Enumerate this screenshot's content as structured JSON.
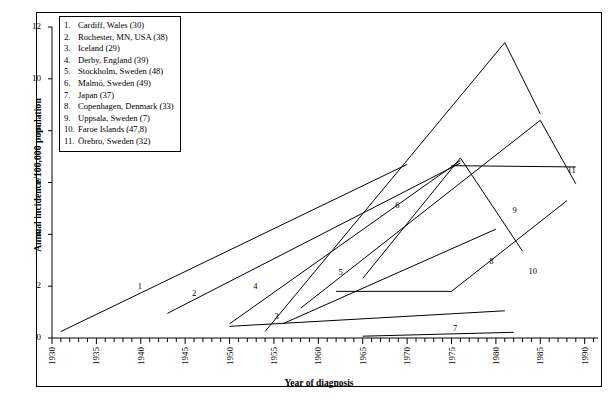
{
  "figure": {
    "title": "",
    "xlabel": "Year of diagnosis",
    "ylabel": "Annual incidence/100,000 population"
  },
  "legend": {
    "position": "top-left-inside",
    "entries": [
      {
        "num": "1.",
        "text": "Cardiff, Wales (30)"
      },
      {
        "num": "2.",
        "text": "Rochester, MN, USA (38)"
      },
      {
        "num": "3.",
        "text": "Iceland (29)"
      },
      {
        "num": "4.",
        "text": "Derby, England (39)"
      },
      {
        "num": "5.",
        "text": "Stockholm, Sweden (48)"
      },
      {
        "num": "6.",
        "text": "Malmö, Sweden (49)"
      },
      {
        "num": "7.",
        "text": "Japan (37)"
      },
      {
        "num": "8.",
        "text": "Copenhagen, Denmark (33)"
      },
      {
        "num": "9.",
        "text": "Uppsala, Sweden (7)"
      },
      {
        "num": "10.",
        "text": "Faroe Islands (47,8)"
      },
      {
        "num": "11.",
        "text": "Örebro, Sweden (32)"
      }
    ]
  },
  "axes": {
    "x_ticks": [
      "1930",
      "1935",
      "1940",
      "1945",
      "1950",
      "1955",
      "1960",
      "1965",
      "1970",
      "1975",
      "1980",
      "1985",
      "1990"
    ],
    "y_ticks": [
      "0",
      "2",
      "4",
      "6",
      "8",
      "10",
      "12"
    ],
    "xlim": [
      1930,
      1991.5
    ],
    "ylim": [
      0,
      12
    ],
    "x_minor_interval": 1,
    "grid": false
  },
  "chart_data": {
    "type": "line",
    "title": "",
    "xlabel": "Year of diagnosis",
    "ylabel": "Annual incidence/100,000 population",
    "xlim": [
      1930,
      1991.5
    ],
    "ylim": [
      0,
      12
    ],
    "x_tick_values": [
      1930,
      1935,
      1940,
      1945,
      1950,
      1955,
      1960,
      1965,
      1970,
      1975,
      1980,
      1985,
      1990
    ],
    "y_tick_values": [
      0,
      2,
      4,
      6,
      8,
      10,
      12
    ],
    "legend_position": "top-left-inside",
    "series": [
      {
        "id": 1,
        "name": "Cardiff, Wales (30)",
        "label": "1",
        "label_x": 1940.0,
        "label_y": 1.95,
        "x": [
          1931,
          1970
        ],
        "y": [
          0.25,
          6.7
        ]
      },
      {
        "id": 2,
        "name": "Rochester, MN, USA (38)",
        "label": "2",
        "label_x": 1946.1,
        "label_y": 1.7,
        "x": [
          1943,
          1976
        ],
        "y": [
          0.95,
          6.75
        ]
      },
      {
        "id": 3,
        "name": "Iceland (29)",
        "label": "3",
        "label_x": 1955.4,
        "label_y": 0.8,
        "x": [
          1950,
          1981
        ],
        "y": [
          0.45,
          1.05
        ]
      },
      {
        "id": 4,
        "name": "Derby, England (39)",
        "label": "4",
        "label_x": 1953.0,
        "label_y": 1.95,
        "x": [
          1950,
          1976
        ],
        "y": [
          0.55,
          6.85
        ]
      },
      {
        "id": 5,
        "name": "Stockholm, Sweden (48)",
        "label": "5",
        "label_x": 1962.6,
        "label_y": 2.5,
        "x": [
          1958,
          1985,
          1989
        ],
        "y": [
          1.15,
          8.4,
          5.95
        ]
      },
      {
        "id": 6,
        "name": "Malmö, Sweden (49)",
        "label": "6",
        "label_x": 1969.0,
        "label_y": 5.1,
        "x": [
          1954,
          1981,
          1985
        ],
        "y": [
          0.25,
          11.4,
          8.65
        ]
      },
      {
        "id": 7,
        "name": "Japan (37)",
        "label": "7",
        "label_x": 1975.5,
        "label_y": 0.36,
        "x": [
          1965,
          1982
        ],
        "y": [
          0.07,
          0.22
        ]
      },
      {
        "id": 8,
        "name": "Copenhagen, Denmark (33)",
        "label": "8",
        "label_x": 1979.6,
        "label_y": 2.95,
        "x": [
          1956,
          1980
        ],
        "y": [
          0.55,
          4.2
        ]
      },
      {
        "id": 9,
        "name": "Uppsala, Sweden (7)",
        "label": "9",
        "label_x": 1982.2,
        "label_y": 4.9,
        "x": [
          1965,
          1976,
          1983
        ],
        "y": [
          2.3,
          6.95,
          3.35
        ]
      },
      {
        "id": 10,
        "name": "Faroe Islands (47,8)",
        "label": "10",
        "label_x": 1984.0,
        "label_y": 2.55,
        "x": [
          1962,
          1975,
          1988
        ],
        "y": [
          1.8,
          1.8,
          5.3
        ]
      },
      {
        "id": 11,
        "name": "Örebro, Sweden (32)",
        "label": "11",
        "label_x": 1988.4,
        "label_y": 6.45,
        "x": [
          1975,
          1989
        ],
        "y": [
          6.65,
          6.6
        ]
      }
    ]
  }
}
